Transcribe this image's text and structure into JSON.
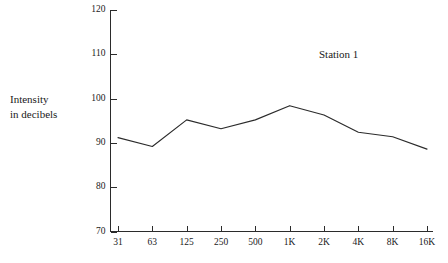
{
  "chart_data": {
    "type": "line",
    "title": "",
    "subtitle": "",
    "xlabel": "",
    "ylabel": "Intensity in decibels",
    "ylabel_line1": "Intensity",
    "ylabel_line2": "in decibels",
    "categories": [
      "31",
      "63",
      "125",
      "250",
      "500",
      "1K",
      "2K",
      "4K",
      "8K",
      "16K"
    ],
    "series": [
      {
        "name": "Station 1",
        "values": [
          91.2,
          89.2,
          95.2,
          93.2,
          95.2,
          98.4,
          96.3,
          92.4,
          91.4,
          88.6
        ]
      }
    ],
    "annotations": [
      {
        "text": "Station 1",
        "x_category": "1K",
        "y_value": 110
      }
    ],
    "ylim": [
      70,
      120
    ],
    "yticks": [
      70,
      80,
      90,
      100,
      110,
      120
    ],
    "ytick_labels": [
      "70",
      "80",
      "90",
      "100",
      "110",
      "120"
    ],
    "grid": false,
    "legend": "none",
    "line_color": "#2b2b2b",
    "axis_color": "#2b2b2b",
    "background": "#ffffff"
  }
}
